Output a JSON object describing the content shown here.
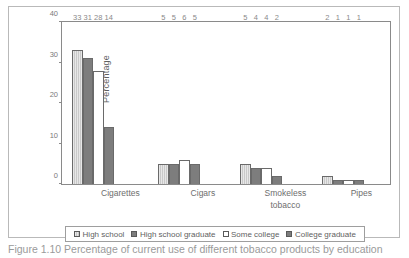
{
  "chart_data": {
    "type": "bar",
    "title": "",
    "xlabel": "",
    "ylabel": "Percentage",
    "ylim": [
      0,
      40
    ],
    "yticks": [
      0,
      10,
      20,
      30,
      40
    ],
    "grid": false,
    "legend_position": "bottom",
    "categories": [
      "Cigarettes",
      "Cigars",
      "Smokeless tobacco",
      "Pipes"
    ],
    "category_lines": [
      [
        "Cigarettes"
      ],
      [
        "Cigars"
      ],
      [
        "Smokeless",
        "tobacco"
      ],
      [
        "Pipes"
      ]
    ],
    "series": [
      {
        "name": "High school",
        "values": [
          33,
          5,
          5,
          2
        ],
        "color": "#c9c9c9"
      },
      {
        "name": "High school graduate",
        "values": [
          31,
          5,
          4,
          1
        ],
        "color": "#7d7d7d"
      },
      {
        "name": "Some college",
        "values": [
          28,
          6,
          4,
          1
        ],
        "color": "#ffffff"
      },
      {
        "name": "College graduate",
        "values": [
          14,
          5,
          2,
          1
        ],
        "color": "#7d7d7d"
      }
    ]
  },
  "caption": {
    "text": "Figure 1.10 Percentage of current use of different tobacco products by education"
  }
}
